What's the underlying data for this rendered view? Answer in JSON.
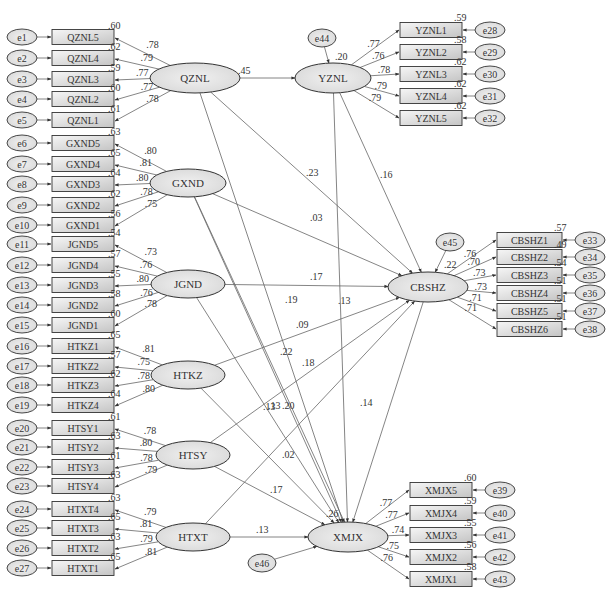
{
  "diagram": {
    "type": "structural-equation-model",
    "colors": {
      "line": "#555555",
      "box_fill_start": "#f4f4f4",
      "box_fill_end": "#c8c8c8",
      "ellipse_fill": "#e4e4e4",
      "stroke": "#333333",
      "text": "#333333"
    },
    "latents": [
      {
        "id": "QZNL",
        "label": "QZNL",
        "cx": 195,
        "cy": 78,
        "rx": 45,
        "ry": 15
      },
      {
        "id": "GXND",
        "label": "GXND",
        "cx": 188,
        "cy": 183,
        "rx": 38,
        "ry": 14
      },
      {
        "id": "JGND",
        "label": "JGND",
        "cx": 188,
        "cy": 284,
        "rx": 37,
        "ry": 14
      },
      {
        "id": "HTKZ",
        "label": "HTKZ",
        "cx": 188,
        "cy": 375,
        "rx": 37,
        "ry": 14
      },
      {
        "id": "HTSY",
        "label": "HTSY",
        "cx": 193,
        "cy": 455,
        "rx": 37,
        "ry": 14
      },
      {
        "id": "HTXT",
        "label": "HTXT",
        "cx": 193,
        "cy": 537,
        "rx": 37,
        "ry": 14
      },
      {
        "id": "YZNL",
        "label": "YZNL",
        "cx": 333,
        "cy": 78,
        "rx": 38,
        "ry": 15
      },
      {
        "id": "CBSHZ",
        "label": "CBSHZ",
        "cx": 428,
        "cy": 287,
        "rx": 40,
        "ry": 15
      },
      {
        "id": "XMJX",
        "label": "XMJX",
        "cx": 348,
        "cy": 537,
        "rx": 40,
        "ry": 15
      }
    ],
    "left_indicators": [
      {
        "group": "QZNL",
        "items": [
          {
            "label": "QZNL5",
            "error": "e1",
            "y": 37,
            "loading": ".78",
            "r2": ".60"
          },
          {
            "label": "QZNL4",
            "error": "e2",
            "y": 58,
            "loading": ".79",
            "r2": ".62"
          },
          {
            "label": "QZNL3",
            "error": "e3",
            "y": 79,
            "loading": ".77",
            "r2": ".59"
          },
          {
            "label": "QZNL2",
            "error": "e4",
            "y": 99,
            "loading": ".77",
            "r2": ".60"
          },
          {
            "label": "QZNL1",
            "error": "e5",
            "y": 120,
            "loading": ".78",
            "r2": ".61"
          }
        ]
      },
      {
        "group": "GXND",
        "items": [
          {
            "label": "GXND5",
            "error": "e6",
            "y": 143,
            "loading": ".80",
            "r2": ".63"
          },
          {
            "label": "GXND4",
            "error": "e7",
            "y": 164,
            "loading": ".81",
            "r2": ".65"
          },
          {
            "label": "GXND3",
            "error": "e8",
            "y": 184,
            "loading": ".80",
            "r2": ".64"
          },
          {
            "label": "GXND2",
            "error": "e9",
            "y": 205,
            "loading": ".78",
            "r2": ".62"
          },
          {
            "label": "GXND1",
            "error": "e10",
            "y": 225,
            "loading": ".75",
            "r2": ".56"
          }
        ]
      },
      {
        "group": "JGND",
        "items": [
          {
            "label": "JGND5",
            "error": "e11",
            "y": 244,
            "loading": ".73",
            "r2": ".54"
          },
          {
            "label": "JGND4",
            "error": "e12",
            "y": 265,
            "loading": ".76",
            "r2": ".57"
          },
          {
            "label": "JGND3",
            "error": "e13",
            "y": 285,
            "loading": ".80",
            "r2": ".55"
          },
          {
            "label": "JGND2",
            "error": "e14",
            "y": 305,
            "loading": ".76",
            "r2": ".58"
          },
          {
            "label": "JGND1",
            "error": "e15",
            "y": 325,
            "loading": ".78",
            "r2": ".60"
          }
        ]
      },
      {
        "group": "HTKZ",
        "items": [
          {
            "label": "HTKZ1",
            "error": "e16",
            "y": 346,
            "loading": ".81",
            "r2": ".65"
          },
          {
            "label": "HTKZ2",
            "error": "e17",
            "y": 366,
            "loading": ".75",
            "r2": ".57"
          },
          {
            "label": "HTKZ3",
            "error": "e18",
            "y": 385,
            "loading": ".78",
            "r2": ".62"
          },
          {
            "label": "HTKZ4",
            "error": "e19",
            "y": 405,
            "loading": ".80",
            "r2": ".64"
          }
        ]
      },
      {
        "group": "HTSY",
        "items": [
          {
            "label": "HTSY1",
            "error": "e20",
            "y": 428,
            "loading": ".78",
            "r2": ".61"
          },
          {
            "label": "HTSY2",
            "error": "e21",
            "y": 447,
            "loading": ".80",
            "r2": ".63"
          },
          {
            "label": "HTSY3",
            "error": "e22",
            "y": 467,
            "loading": ".78",
            "r2": ".61"
          },
          {
            "label": "HTSY4",
            "error": "e23",
            "y": 486,
            "loading": ".79",
            "r2": ".63"
          }
        ]
      },
      {
        "group": "HTXT",
        "items": [
          {
            "label": "HTXT4",
            "error": "e24",
            "y": 509,
            "loading": ".79",
            "r2": ".63"
          },
          {
            "label": "HTXT3",
            "error": "e25",
            "y": 528,
            "loading": ".81",
            "r2": ".65"
          },
          {
            "label": "HTXT2",
            "error": "e26",
            "y": 548,
            "loading": ".79",
            "r2": ".63"
          },
          {
            "label": "HTXT1",
            "error": "e27",
            "y": 568,
            "loading": ".81",
            "r2": ".65"
          }
        ]
      }
    ],
    "right_indicators": [
      {
        "group": "YZNL",
        "x": 400,
        "items": [
          {
            "label": "YZNL1",
            "error": "e28",
            "y": 30,
            "loading": ".77",
            "r2": ".59"
          },
          {
            "label": "YZNL2",
            "error": "e29",
            "y": 52,
            "loading": ".76",
            "r2": ".58"
          },
          {
            "label": "YZNL3",
            "error": "e30",
            "y": 74,
            "loading": ".78",
            "r2": ".62"
          },
          {
            "label": "YZNL4",
            "error": "e31",
            "y": 96,
            "loading": ".79",
            "r2": ".62"
          },
          {
            "label": "YZNL5",
            "error": "e32",
            "y": 118,
            "loading": ".79",
            "r2": ".62"
          }
        ]
      },
      {
        "group": "CBSHZ",
        "x": 497,
        "items": [
          {
            "label": "CBSHZ1",
            "error": "e33",
            "y": 240,
            "loading": ".76",
            "r2": ".57"
          },
          {
            "label": "CBSHZ2",
            "error": "e34",
            "y": 257,
            "loading": ".70",
            "r2": ".49"
          },
          {
            "label": "CBSHZ3",
            "error": "e35",
            "y": 275,
            "loading": ".73",
            "r2": ".54"
          },
          {
            "label": "CBSHZ4",
            "error": "e36",
            "y": 293,
            "loading": ".73",
            "r2": ".51"
          },
          {
            "label": "CBSHZ5",
            "error": "e37",
            "y": 311,
            "loading": ".71",
            "r2": ".51"
          },
          {
            "label": "CBSHZ6",
            "error": "e38",
            "y": 329,
            "loading": ".71",
            "r2": ".51"
          }
        ]
      },
      {
        "group": "XMJX",
        "x": 410,
        "items": [
          {
            "label": "XMJX5",
            "error": "e39",
            "y": 490,
            "loading": ".77",
            "r2": ".60"
          },
          {
            "label": "XMJX4",
            "error": "e40",
            "y": 513,
            "loading": ".77",
            "r2": ".59"
          },
          {
            "label": "XMJX3",
            "error": "e41",
            "y": 535,
            "loading": ".74",
            "r2": ".55"
          },
          {
            "label": "XMJX2",
            "error": "e42",
            "y": 557,
            "loading": ".75",
            "r2": ".56"
          },
          {
            "label": "XMJX1",
            "error": "e43",
            "y": 579,
            "loading": ".76",
            "r2": ".58"
          }
        ]
      }
    ],
    "disturbances": [
      {
        "label": "e44",
        "target": "YZNL",
        "cx": 322,
        "cy": 38,
        "r2": ".20"
      },
      {
        "label": "e45",
        "target": "CBSHZ",
        "cx": 450,
        "cy": 242,
        "r2": ".22"
      },
      {
        "label": "e46",
        "target": "XMJX",
        "cx": 262,
        "cy": 563,
        "r2": ".26"
      }
    ],
    "structural_paths": [
      {
        "from": "QZNL",
        "to": "YZNL",
        "coef": ".45",
        "lx": 238,
        "ly": 74
      },
      {
        "from": "QZNL",
        "to": "CBSHZ",
        "coef": ".23",
        "lx": 306,
        "ly": 176
      },
      {
        "from": "QZNL",
        "to": "XMJX",
        "coef": ".19",
        "lx": 285,
        "ly": 303
      },
      {
        "from": "YZNL",
        "to": "CBSHZ",
        "coef": ".16",
        "lx": 380,
        "ly": 178
      },
      {
        "from": "YZNL",
        "to": "XMJX",
        "coef": ".13",
        "lx": 338,
        "ly": 304
      },
      {
        "from": "GXND",
        "to": "CBSHZ",
        "coef": ".03",
        "lx": 310,
        "ly": 221
      },
      {
        "from": "GXND",
        "to": "XMJX",
        "coef": ".13",
        "lx": 263,
        "ly": 410
      },
      {
        "from": "JGND",
        "to": "CBSHZ",
        "coef": ".17",
        "lx": 310,
        "ly": 280
      },
      {
        "from": "JGND",
        "to": "XMJX",
        "coef": ".22",
        "lx": 280,
        "ly": 355
      },
      {
        "from": "HTKZ",
        "to": "CBSHZ",
        "coef": ".09",
        "lx": 296,
        "ly": 328
      },
      {
        "from": "HTKZ",
        "to": "XMJX",
        "coef": ".13",
        "lx": 268,
        "ly": 409
      },
      {
        "from": "HTSY",
        "to": "CBSHZ",
        "coef": ".18",
        "lx": 302,
        "ly": 366
      },
      {
        "from": "HTSY",
        "to": "XMJX",
        "coef": ".17",
        "lx": 270,
        "ly": 493
      },
      {
        "from": "HTXT",
        "to": "CBSHZ",
        "coef": ".02",
        "lx": 282,
        "ly": 458
      },
      {
        "from": "HTXT",
        "to": "XMJX",
        "coef": ".13",
        "lx": 256,
        "ly": 533
      },
      {
        "from": "CBSHZ",
        "to": "XMJX",
        "coef": ".14",
        "lx": 360,
        "ly": 406
      },
      {
        "from": "GXND",
        "to": "XMJX_b",
        "coef": ".20",
        "lx": 282,
        "ly": 409
      }
    ]
  }
}
